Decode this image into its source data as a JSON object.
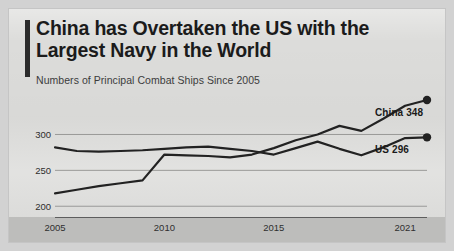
{
  "card": {
    "title": "China has Overtaken the US with the Largest Navy in the World",
    "subtitle": "Numbers of Principal Combat Ships Since 2005",
    "accent_color": "#2b2b2b",
    "background_color": "#dcdcda"
  },
  "labels": {
    "china": "China 348",
    "us": "US 296"
  },
  "chart_data": {
    "type": "line",
    "title": "China has Overtaken the US with the Largest Navy in the World",
    "subtitle": "Numbers of Principal Combat Ships Since 2005",
    "xlabel": "",
    "ylabel": "",
    "grid": true,
    "legend_position": "right-inline-endpoint-labels",
    "line_color": "#222222",
    "gridline_color": "#9a9a98",
    "x": [
      2005,
      2006,
      2007,
      2008,
      2009,
      2010,
      2011,
      2012,
      2013,
      2014,
      2015,
      2016,
      2017,
      2018,
      2019,
      2020,
      2021,
      2022
    ],
    "xlim": [
      2005,
      2022
    ],
    "ylim": [
      185,
      355
    ],
    "xticks": [
      2005,
      2010,
      2015,
      2021
    ],
    "xticklabels": [
      "2005",
      "2010",
      "2015",
      "2021"
    ],
    "yticks": [
      200,
      250,
      300
    ],
    "yticklabels": [
      "200",
      "250",
      "300"
    ],
    "series": [
      {
        "name": "China",
        "end_label": "China 348",
        "end_value": 348,
        "marker_at_end": true,
        "values": [
          218,
          223,
          228,
          232,
          236,
          272,
          271,
          270,
          268,
          272,
          281,
          292,
          300,
          312,
          305,
          322,
          340,
          348
        ]
      },
      {
        "name": "US",
        "end_label": "US 296",
        "end_value": 296,
        "marker_at_end": true,
        "values": [
          282,
          277,
          276,
          277,
          278,
          280,
          282,
          283,
          280,
          277,
          272,
          281,
          290,
          280,
          271,
          282,
          295,
          296
        ]
      }
    ]
  }
}
